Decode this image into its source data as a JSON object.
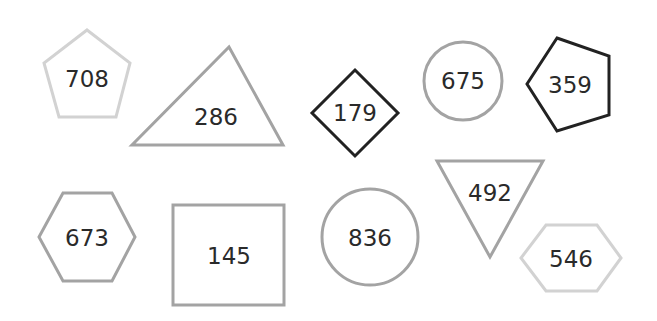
{
  "colors": {
    "light": "#d2d2d2",
    "mid": "#a3a3a3",
    "dark": "#222222",
    "text": "#2a2a2a"
  },
  "shapes": [
    {
      "type": "pentagon",
      "label": "708",
      "stroke": "light"
    },
    {
      "type": "triangle",
      "label": "286",
      "stroke": "mid"
    },
    {
      "type": "diamond",
      "label": "179",
      "stroke": "dark"
    },
    {
      "type": "circle",
      "label": "675",
      "stroke": "mid"
    },
    {
      "type": "pentagon-rotated",
      "label": "359",
      "stroke": "dark"
    },
    {
      "type": "hexagon",
      "label": "673",
      "stroke": "mid"
    },
    {
      "type": "rectangle",
      "label": "145",
      "stroke": "mid"
    },
    {
      "type": "circle",
      "label": "836",
      "stroke": "mid"
    },
    {
      "type": "inverted-triangle",
      "label": "492",
      "stroke": "mid"
    },
    {
      "type": "hexagon",
      "label": "546",
      "stroke": "light"
    }
  ]
}
